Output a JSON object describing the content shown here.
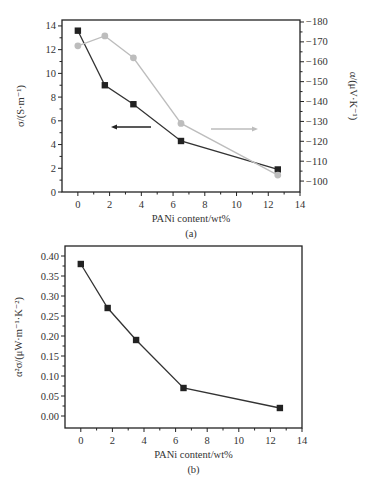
{
  "chart_data": [
    {
      "type": "line",
      "panel_caption": "(a)",
      "xlabel": "PANi content/wt%",
      "ylabel": "σ/(S·m⁻¹)",
      "ylabel_right": "α/(μV·K⁻¹)",
      "x_ticks": [
        0,
        2,
        4,
        6,
        8,
        10,
        12,
        14
      ],
      "xlim": [
        -1,
        14
      ],
      "ylim": [
        0,
        14.5
      ],
      "y_ticks": [
        0,
        2,
        4,
        6,
        8,
        10,
        12,
        14
      ],
      "ylim_right": [
        -94.5,
        -181
      ],
      "y_ticks_right": [
        -100,
        -110,
        -120,
        -130,
        -140,
        -150,
        -160,
        -170,
        -180
      ],
      "grid": false,
      "series": [
        {
          "name": "σ (conductivity)",
          "axis": "left",
          "marker": "square",
          "color": "#222222",
          "x": [
            0,
            1.7,
            3.5,
            6.5,
            12.6
          ],
          "values": [
            13.6,
            9.0,
            7.4,
            4.3,
            1.9
          ]
        },
        {
          "name": "α (Seebeck coefficient)",
          "axis": "right",
          "marker": "circle",
          "color": "#bdbdbd",
          "x": [
            0,
            1.7,
            3.5,
            6.5,
            12.6
          ],
          "values": [
            -168,
            -173,
            -162,
            -129,
            -103
          ]
        }
      ],
      "annotations": [
        {
          "type": "arrow",
          "direction": "left",
          "meaning": "σ uses left axis",
          "color": "#222222"
        },
        {
          "type": "arrow",
          "direction": "right",
          "meaning": "α uses right axis",
          "color": "#bdbdbd"
        }
      ]
    },
    {
      "type": "line",
      "panel_caption": "(b)",
      "xlabel": "PANi content/wt%",
      "ylabel": "α²σ/(μW·m⁻¹·K⁻²)",
      "x_ticks": [
        0,
        2,
        4,
        6,
        8,
        10,
        12,
        14
      ],
      "xlim": [
        -1,
        14
      ],
      "ylim": [
        -0.03,
        0.425
      ],
      "y_ticks": [
        0.0,
        0.05,
        0.1,
        0.15,
        0.2,
        0.25,
        0.3,
        0.35,
        0.4
      ],
      "grid": false,
      "series": [
        {
          "name": "Power factor",
          "marker": "square",
          "color": "#222222",
          "x": [
            0,
            1.7,
            3.5,
            6.5,
            12.6
          ],
          "values": [
            0.38,
            0.27,
            0.19,
            0.07,
            0.02
          ]
        }
      ]
    }
  ]
}
